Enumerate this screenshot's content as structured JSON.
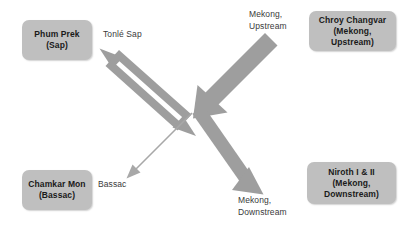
{
  "diagram": {
    "type": "flow-diagram",
    "title": "",
    "colors": {
      "node_fill": "#bfbfbf",
      "node_text": "#1a1a1a",
      "arrow": "#9e9e9e",
      "label_text": "#3a3a3a",
      "background": "#ffffff"
    },
    "center_hub": {
      "x": 196,
      "y": 110
    },
    "nodes": [
      {
        "id": "phum-prek",
        "label": "Phum Prek\n(Sap)",
        "position": "top-left"
      },
      {
        "id": "chroy-changvar",
        "label": "Chroy Changvar\n(Mekong,\nUpstream)",
        "position": "top-right"
      },
      {
        "id": "chamkar-mon",
        "label": "Chamkar Mon\n(Bassac)",
        "position": "bottom-left"
      },
      {
        "id": "niroth",
        "label": "Niroth I & II\n(Mekong,\nDownstream)",
        "position": "bottom-right"
      }
    ],
    "edges": [
      {
        "id": "tonle-sap",
        "label": "Tonlé Sap",
        "style": "double-headed",
        "weight": "medium",
        "from": "center-hub",
        "to": "phum-prek",
        "direction": "bidirectional"
      },
      {
        "id": "mekong-upstream",
        "label": "Mekong,\nUpstream",
        "style": "single-headed",
        "weight": "very-thick",
        "from": "chroy-changvar",
        "to": "center-hub",
        "direction": "inbound"
      },
      {
        "id": "bassac",
        "label": "Bassac",
        "style": "single-headed",
        "weight": "thin",
        "from": "center-hub",
        "to": "chamkar-mon",
        "direction": "outbound"
      },
      {
        "id": "mekong-downstream",
        "label": "Mekong,\nDownstream",
        "style": "single-headed",
        "weight": "thick",
        "from": "center-hub",
        "to": "niroth",
        "direction": "outbound"
      }
    ]
  }
}
